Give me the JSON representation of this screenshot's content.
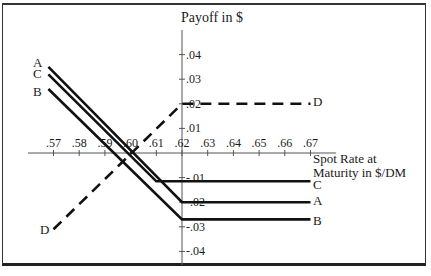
{
  "chart_data": {
    "type": "line",
    "title": "",
    "ylabel": "Payoff in $",
    "xlabel_lines": [
      "Spot Rate at",
      "Maturity in $/DM"
    ],
    "x_ticks": [
      0.57,
      0.58,
      0.59,
      0.6,
      0.61,
      0.62,
      0.63,
      0.64,
      0.65,
      0.66,
      0.67
    ],
    "x_tick_labels": [
      ".57",
      ".58",
      ".59",
      ".60",
      ".61",
      ".62",
      ".63",
      ".64",
      ".65",
      ".66",
      ".67"
    ],
    "y_ticks": [
      0.04,
      0.03,
      0.02,
      0.01,
      -0.01,
      -0.02,
      -0.03,
      -0.04
    ],
    "y_tick_labels": [
      ".04",
      ".03",
      ".02",
      ".01",
      "-.01",
      "-.02",
      "-.03",
      "-.04"
    ],
    "xlim": [
      0.56,
      0.68
    ],
    "ylim": [
      -0.045,
      0.05
    ],
    "grid": false,
    "legend": "inline labels at line ends",
    "series": [
      {
        "name": "A",
        "style": "solid",
        "x": [
          0.568,
          0.62,
          0.67
        ],
        "y": [
          0.035,
          -0.02,
          -0.02
        ]
      },
      {
        "name": "C",
        "style": "solid",
        "x": [
          0.568,
          0.61,
          0.67
        ],
        "y": [
          0.032,
          -0.0115,
          -0.0115
        ]
      },
      {
        "name": "B",
        "style": "solid",
        "x": [
          0.568,
          0.62,
          0.67
        ],
        "y": [
          0.026,
          -0.027,
          -0.027
        ]
      },
      {
        "name": "D",
        "style": "dashed",
        "x": [
          0.57,
          0.62,
          0.67
        ],
        "y": [
          -0.031,
          0.02,
          0.02
        ]
      }
    ]
  },
  "labels": {
    "y_axis_title": "Payoff in $",
    "x_axis_title_1": "Spot Rate at",
    "x_axis_title_2": "Maturity in $/DM",
    "series_left": {
      "A": "A",
      "C": "C",
      "B": "B",
      "D": "D"
    },
    "series_right": {
      "A": "A",
      "C": "C",
      "B": "B",
      "D": "D"
    }
  }
}
